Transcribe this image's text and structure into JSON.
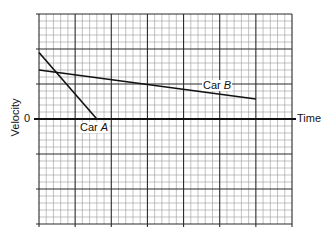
{
  "chart_data": {
    "type": "line",
    "title": "",
    "xlabel": "Time",
    "ylabel": "Velocity",
    "y_tick_labels": [
      "0"
    ],
    "grid": {
      "on": true,
      "major_columns": 7,
      "major_rows": 6,
      "minor_per_major": 5
    },
    "xlim": [
      0,
      7
    ],
    "ylim": [
      -3,
      3
    ],
    "series": [
      {
        "name": "Car A",
        "points": [
          [
            0,
            1.9
          ],
          [
            1.6,
            0
          ]
        ]
      },
      {
        "name": "Car B",
        "points": [
          [
            0,
            1.4
          ],
          [
            6.0,
            0.57
          ]
        ]
      }
    ],
    "annotations": [
      "Car A",
      "Car B"
    ]
  },
  "labels": {
    "ylabel": "Velocity",
    "xlabel": "Time",
    "zero": "0",
    "carA_prefix": "Car ",
    "carA_letter": "A",
    "carB_prefix": "Car ",
    "carB_letter": "B"
  }
}
